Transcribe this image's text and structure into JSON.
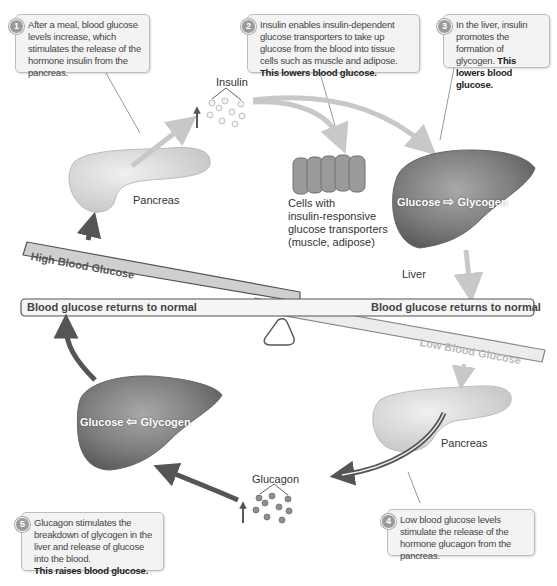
{
  "callouts": [
    {
      "number": "1",
      "text": "After a meal, blood glucose levels increase, which stimulates the release of the hormone insulin from the pancreas.",
      "bold": ""
    },
    {
      "number": "2",
      "text": "Insulin enables insulin-dependent glucose transporters to take up glucose from the blood into tissue cells such as muscle and adipose.",
      "bold": "This lowers blood glucose."
    },
    {
      "number": "3",
      "text": "In the liver, insulin promotes the formation of glycogen.",
      "bold": "This lowers blood glucose."
    },
    {
      "number": "4",
      "text": "Low blood glucose levels stimulate the release of the hormone glucagon from the pancreas.",
      "bold": ""
    },
    {
      "number": "5",
      "text": "Glucagon stimulates the breakdown of glycogen in the liver and release of glucose into the blood.",
      "bold": "This raises blood glucose."
    }
  ],
  "labels": {
    "insulin": "Insulin",
    "glucagon": "Glucagon",
    "pancreas_top": "Pancreas",
    "pancreas_bottom": "Pancreas",
    "liver": "Liver",
    "cells_line1": "Cells with",
    "cells_line2": "insulin-responsive",
    "cells_line3": "glucose transporters",
    "cells_line4": "(muscle, adipose)"
  },
  "liver_top": {
    "left": "Glucose",
    "arrow": "⇨",
    "right": "Glycogen"
  },
  "liver_bottom": {
    "left": "Glucose",
    "arrow": "⇦",
    "right": "Glycogen"
  },
  "seesaw": {
    "high": "High Blood Glucose",
    "low": "Low Blood Glucose",
    "normal_left": "Blood glucose returns to normal",
    "normal_right": "Blood glucose returns to normal"
  },
  "colors": {
    "insulin_arrow": "#c8c8c8",
    "glucagon_arrow": "#555555",
    "organ": "#8a8a8a",
    "pancreas": "#dcdcdc"
  }
}
